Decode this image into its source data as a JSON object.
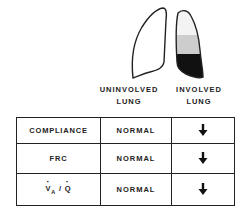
{
  "figure": {
    "lungs": [
      {
        "id": "uninvolved",
        "label_line1": "UNINVOLVED",
        "label_line2": "LUNG",
        "fill": "none",
        "outline": "#222222"
      },
      {
        "id": "involved",
        "label_line1": "INVOLVED",
        "label_line2": "LUNG",
        "fill_zones": [
          {
            "zone": "upper",
            "color": "#f2f2f2"
          },
          {
            "zone": "middle",
            "color": "#cfcfcf"
          },
          {
            "zone": "lower",
            "color": "#111111"
          }
        ],
        "outline": "#222222"
      }
    ],
    "table": {
      "rows": [
        {
          "property": "COMPLIANCE",
          "uninvolved": "NORMAL",
          "involved": "decreased",
          "involved_icon": "down-arrow-icon"
        },
        {
          "property": "FRC",
          "uninvolved": "NORMAL",
          "involved": "decreased",
          "involved_icon": "down-arrow-icon"
        },
        {
          "property_main": "V",
          "property_sub": "A",
          "property_sep": " / ",
          "property_end": "Q",
          "uninvolved": "NORMAL",
          "involved": "decreased",
          "involved_icon": "down-arrow-icon"
        }
      ]
    }
  }
}
